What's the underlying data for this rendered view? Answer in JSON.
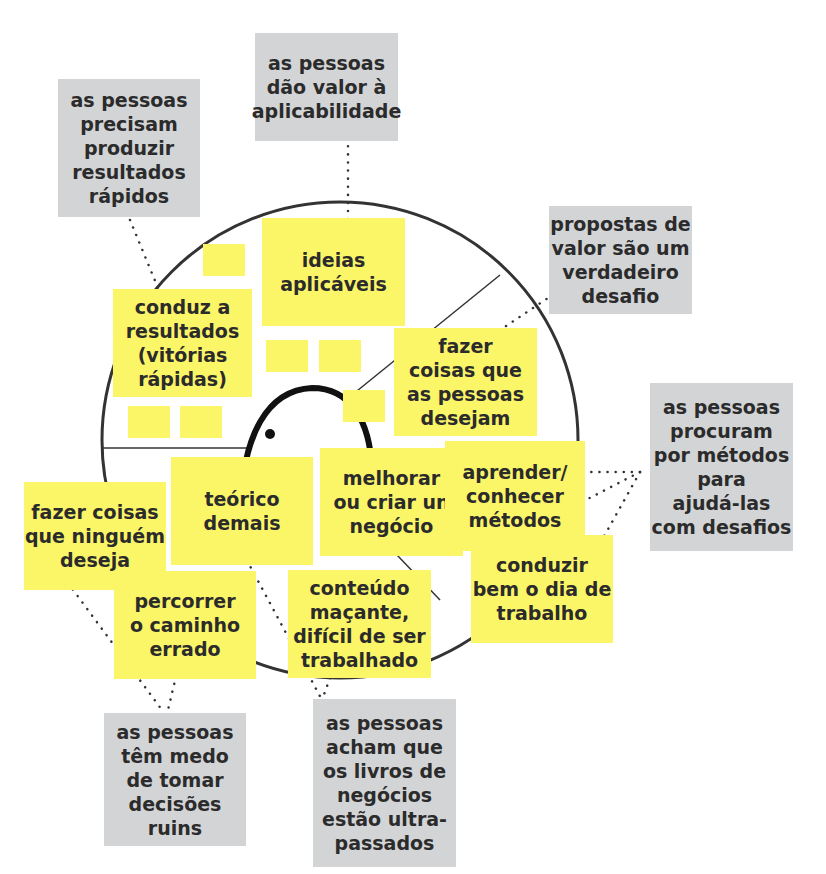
{
  "colors": {
    "sticky_yellow": "#fbf568",
    "sticky_gray": "#d3d4d6",
    "ink": "#2b2b2b",
    "line": "#333333"
  },
  "value_proposition": {
    "gain_creators": {
      "label": "ideias\naplicáveis"
    },
    "gain_quick_wins": {
      "label": "conduz a\nresultados\n(vitórias\nrápidas)"
    },
    "product": {
      "label": "fazer\ncoisas que\nas pessoas\ndesejam"
    },
    "pain_relievers": [
      {
        "label": "teórico\ndemais"
      },
      {
        "label": "fazer coisas\nque ninguém\ndeseja"
      },
      {
        "label": "percorrer\no caminho\nerrado"
      },
      {
        "label": "conteúdo\nmaçante,\ndifícil de ser\ntrabalhado"
      }
    ]
  },
  "customer_jobs": [
    {
      "label": "melhorar\nou criar un\nnegócio"
    },
    {
      "label": "aprender/\nconhecer\nmétodos"
    },
    {
      "label": "conduzir\nbem o dia de\ntrabalho"
    }
  ],
  "insights": [
    {
      "label": "as pessoas\nprecisam\nproduzir\nresultados\nrápidos"
    },
    {
      "label": "as pessoas\ndão valor à\naplicabilidade"
    },
    {
      "label": "propostas de\nvalor são um\nverdadeiro\ndesafio"
    },
    {
      "label": "as pessoas\nprocuram\npor métodos\npara\najudá-las\ncom desafios"
    },
    {
      "label": "as pessoas\ntêm medo\nde tomar\ndecisões\nruins"
    },
    {
      "label": "as pessoas\nacham que\nos livros de\nnegócios\nestão ultra-\npassados"
    }
  ]
}
